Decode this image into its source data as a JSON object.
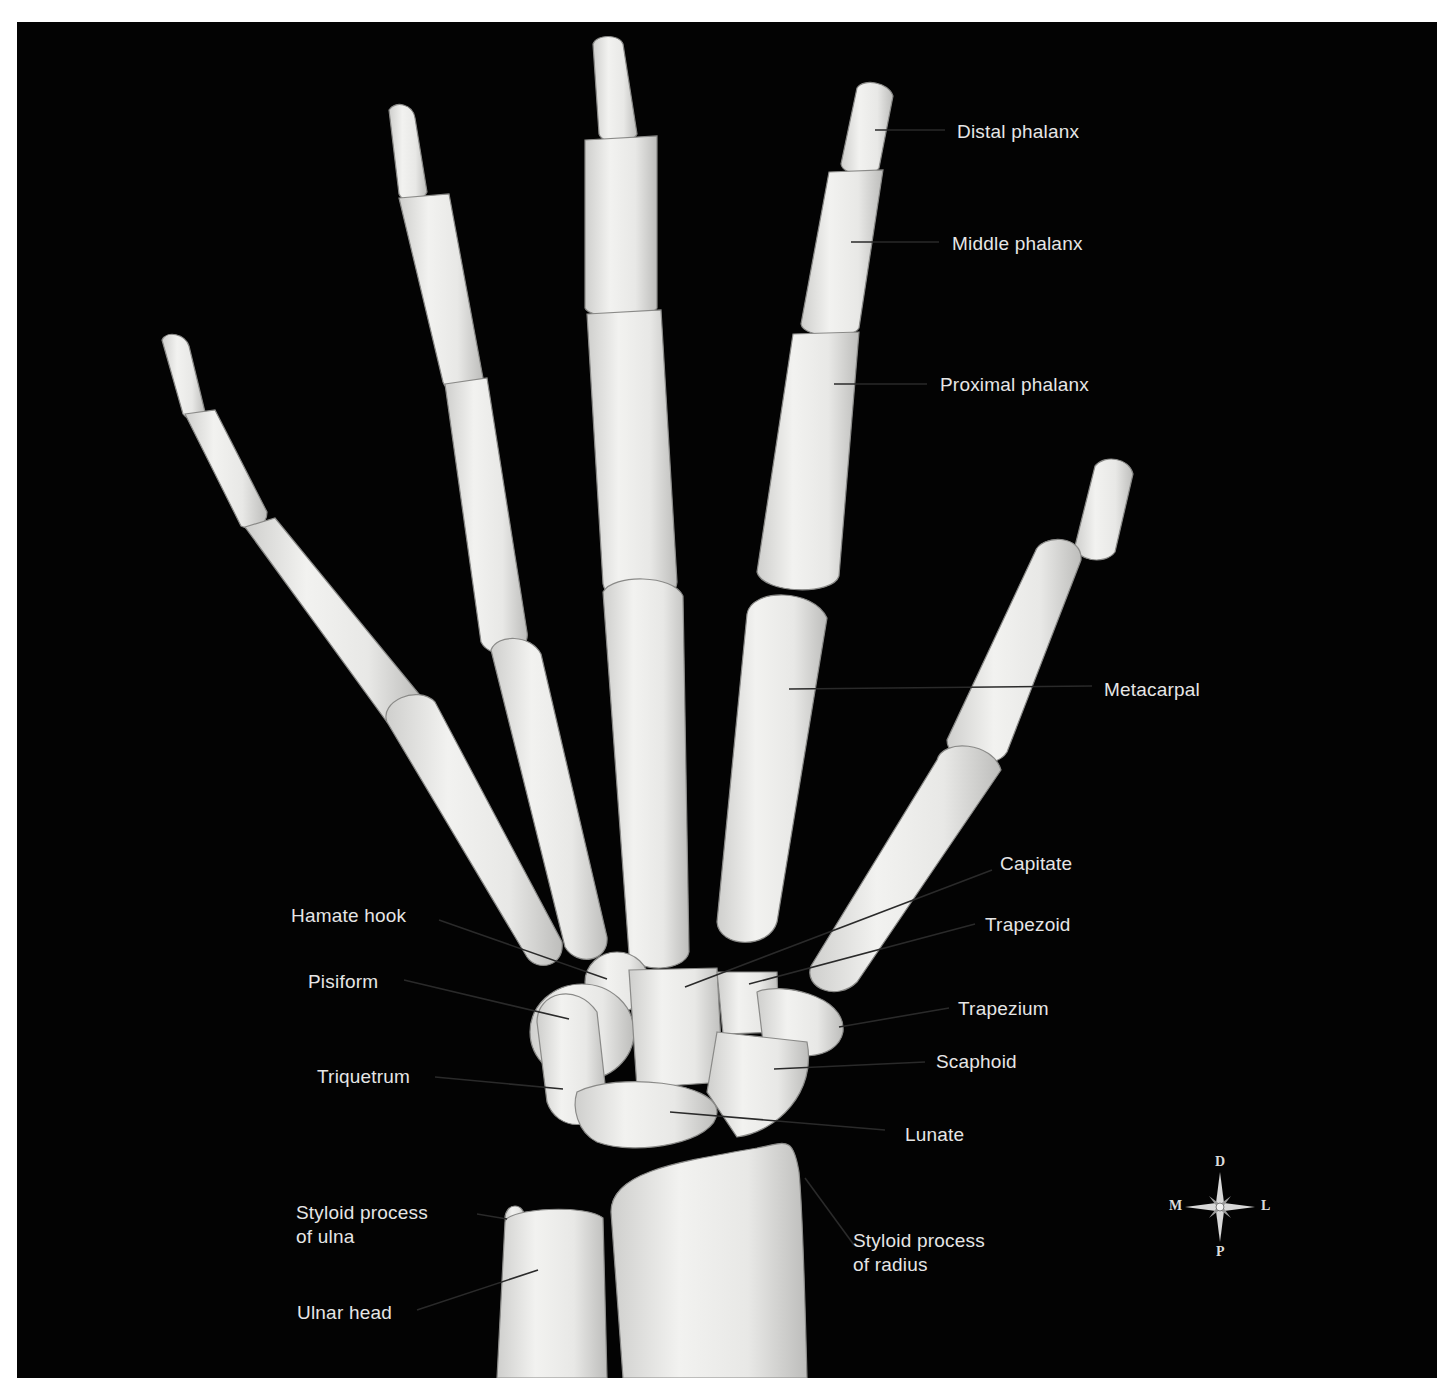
{
  "figure": {
    "view": "dorsal",
    "background_color": "#030303",
    "bone_color": "#e9e9e7",
    "label_color": "#e6e6e6",
    "leader_color": "#1a1a1a"
  },
  "labels": {
    "distal_phalanx": "Distal phalanx",
    "middle_phalanx": "Middle phalanx",
    "proximal_phalanx": "Proximal phalanx",
    "metacarpal": "Metacarpal",
    "capitate": "Capitate",
    "trapezoid": "Trapezoid",
    "trapezium": "Trapezium",
    "scaphoid": "Scaphoid",
    "lunate": "Lunate",
    "hamate_hook": "Hamate hook",
    "pisiform": "Pisiform",
    "triquetrum": "Triquetrum",
    "styloid_ulna_line1": "Styloid process",
    "styloid_ulna_line2": "of ulna",
    "styloid_radius_line1": "Styloid process",
    "styloid_radius_line2": "of radius",
    "ulnar_head": "Ulnar head"
  },
  "compass": {
    "top": "D",
    "bottom": "P",
    "left": "M",
    "right": "L"
  }
}
